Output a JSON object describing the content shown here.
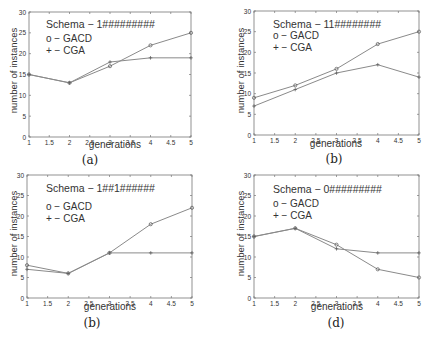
{
  "chart_data": [
    {
      "type": "line",
      "panel_label": "(a)",
      "title": "Schema − 1#########",
      "xlabel": "generations",
      "ylabel": "number of instances",
      "x": [
        1,
        2,
        3,
        4,
        5
      ],
      "xticks": [
        "1",
        "1.5",
        "2",
        "2.5",
        "3",
        "3.5",
        "4",
        "4.5",
        "5"
      ],
      "yticks": [
        "0",
        "5",
        "10",
        "15",
        "20",
        "25",
        "30"
      ],
      "xlim": [
        1,
        5
      ],
      "ylim": [
        0,
        30
      ],
      "legend": [
        "o − GACD",
        "+ − CGA"
      ],
      "series": [
        {
          "name": "GACD",
          "marker": "o",
          "values": [
            15,
            13,
            17,
            22,
            25
          ]
        },
        {
          "name": "CGA",
          "marker": "+",
          "values": [
            15,
            13,
            18,
            19,
            19
          ]
        }
      ]
    },
    {
      "type": "line",
      "panel_label": "(b)",
      "title": "Schema − 11########",
      "xlabel": "generations",
      "ylabel": "number of instances",
      "x": [
        1,
        2,
        3,
        4,
        5
      ],
      "xticks": [
        "1",
        "1.5",
        "2",
        "2.5",
        "3",
        "3.5",
        "4",
        "4.5",
        "5"
      ],
      "yticks": [
        "0",
        "5",
        "10",
        "15",
        "20",
        "25",
        "30"
      ],
      "xlim": [
        1,
        5
      ],
      "ylim": [
        0,
        30
      ],
      "legend": [
        "o − GACD",
        "+ − CGA"
      ],
      "series": [
        {
          "name": "GACD",
          "marker": "o",
          "values": [
            9,
            12,
            16,
            22,
            25
          ]
        },
        {
          "name": "CGA",
          "marker": "+",
          "values": [
            7,
            11,
            15,
            17,
            14
          ]
        }
      ]
    },
    {
      "type": "line",
      "panel_label": "(b)",
      "title": "Schema − 1##1######",
      "xlabel": "generations",
      "ylabel": "number of instances",
      "x": [
        1,
        2,
        3,
        4,
        5
      ],
      "xticks": [
        "1",
        "1.5",
        "2",
        "2.5",
        "3",
        "3.5",
        "4",
        "4.5",
        "5"
      ],
      "yticks": [
        "0",
        "5",
        "10",
        "15",
        "20",
        "25",
        "30"
      ],
      "xlim": [
        1,
        5
      ],
      "ylim": [
        0,
        30
      ],
      "legend": [
        "o − GACD",
        "+ − CGA"
      ],
      "series": [
        {
          "name": "GACD",
          "marker": "o",
          "values": [
            8,
            6,
            11,
            18,
            22
          ]
        },
        {
          "name": "CGA",
          "marker": "+",
          "values": [
            7,
            6,
            11,
            11,
            11
          ]
        }
      ]
    },
    {
      "type": "line",
      "panel_label": "(d)",
      "title": "Schema − 0#########",
      "xlabel": "generations",
      "ylabel": "number of instances",
      "x": [
        1,
        2,
        3,
        4,
        5
      ],
      "xticks": [
        "1",
        "1.5",
        "2",
        "2.5",
        "3",
        "3.5",
        "4",
        "4.5",
        "5"
      ],
      "yticks": [
        "0",
        "5",
        "10",
        "15",
        "20",
        "25",
        "30"
      ],
      "xlim": [
        1,
        5
      ],
      "ylim": [
        0,
        30
      ],
      "legend": [
        "o − GACD",
        "+ − CGA"
      ],
      "series": [
        {
          "name": "GACD",
          "marker": "o",
          "values": [
            15,
            17,
            13,
            7,
            5
          ]
        },
        {
          "name": "CGA",
          "marker": "+",
          "values": [
            15,
            17,
            12,
            11,
            11
          ]
        }
      ]
    }
  ],
  "panels": [
    {
      "caption": "(a)",
      "schema": "Schema − 1#########",
      "legend_gacd": "o − GACD",
      "legend_cga": "+ − CGA",
      "xlabel": "generations",
      "ylabel": "number of instances"
    },
    {
      "caption": "(b)",
      "schema": "Schema − 11########",
      "legend_gacd": "o − GACD",
      "legend_cga": "+ − CGA",
      "xlabel": "generations",
      "ylabel": "number of instances"
    },
    {
      "caption": "(b)",
      "schema": "Schema − 1##1######",
      "legend_gacd": "o − GACD",
      "legend_cga": "+ − CGA",
      "xlabel": "generations",
      "ylabel": "number of instances"
    },
    {
      "caption": "(d)",
      "schema": "Schema − 0#########",
      "legend_gacd": "o − GACD",
      "legend_cga": "+ − CGA",
      "xlabel": "generations",
      "ylabel": "number of instances"
    }
  ],
  "colors": {
    "axis": "#777777",
    "line": "#8a8a8a",
    "text": "#333333"
  }
}
